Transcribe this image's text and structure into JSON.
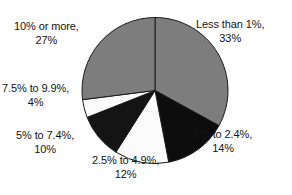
{
  "chart_data": {
    "type": "pie",
    "title": "",
    "subtitle": "",
    "xlabel": "",
    "ylabel": "",
    "legend_position": "labels-around-pie",
    "grid": false,
    "start_angle_deg": 0,
    "direction": "clockwise",
    "units": "percent",
    "categories": [
      "Less than 1%",
      "1% to 2.4%",
      "2.5% to 4.9%",
      "5% to 7.4%",
      "7.5% to 9.9%",
      "10% or more"
    ],
    "values": [
      33,
      14,
      12,
      10,
      4,
      27
    ],
    "total": 100,
    "slices": [
      {
        "id": "less-than-1",
        "category": "Less than 1%",
        "value": 33,
        "value_label": "33%",
        "color": "#7d7d7d",
        "stroke": "#1a1a1a"
      },
      {
        "id": "1-to-2-4",
        "category": "1% to 2.4%",
        "value": 14,
        "value_label": "14%",
        "color": "#0d0d0d",
        "stroke": "#1a1a1a"
      },
      {
        "id": "2-5-to-4-9",
        "category": "2.5% to 4.9%",
        "value": 12,
        "value_label": "12%",
        "color": "#fbfbfb",
        "stroke": "#1a1a1a"
      },
      {
        "id": "5-to-7-4",
        "category": "5% to 7.4%",
        "value": 10,
        "value_label": "10%",
        "color": "#141414",
        "stroke": "#1a1a1a"
      },
      {
        "id": "7-5-to-9-9",
        "category": "7.5% to 9.9%",
        "value": 4,
        "value_label": "4%",
        "color": "#fbfbfb",
        "stroke": "#1a1a1a"
      },
      {
        "id": "10-or-more",
        "category": "10% or more",
        "value": 27,
        "value_label": "27%",
        "color": "#7d7d7d",
        "stroke": "#1a1a1a"
      }
    ]
  },
  "labels": {
    "less_than_1": {
      "category": "Less than 1%,",
      "value": "33%"
    },
    "one_to_two_four": {
      "category": "1% to 2.4%,",
      "value": "14%"
    },
    "two_five_to_four_nine": {
      "category": "2.5% to 4.9%,",
      "value": "12%"
    },
    "five_to_seven_four": {
      "category": "5% to 7.4%,",
      "value": "10%"
    },
    "seven_five_to_nine_nine": {
      "category": "7.5% to 9.9%,",
      "value": "4%"
    },
    "ten_or_more": {
      "category": "10% or more,",
      "value": "27%"
    }
  },
  "geometry": {
    "cx": 155,
    "cy": 90.5,
    "r": 73
  },
  "colors": {
    "background": "#ffffff",
    "gray_slice": "#7d7d7d",
    "black_slice": "#0d0d0d",
    "white_slice": "#fbfbfb",
    "outline": "#1a1a1a",
    "text": "#141414"
  }
}
